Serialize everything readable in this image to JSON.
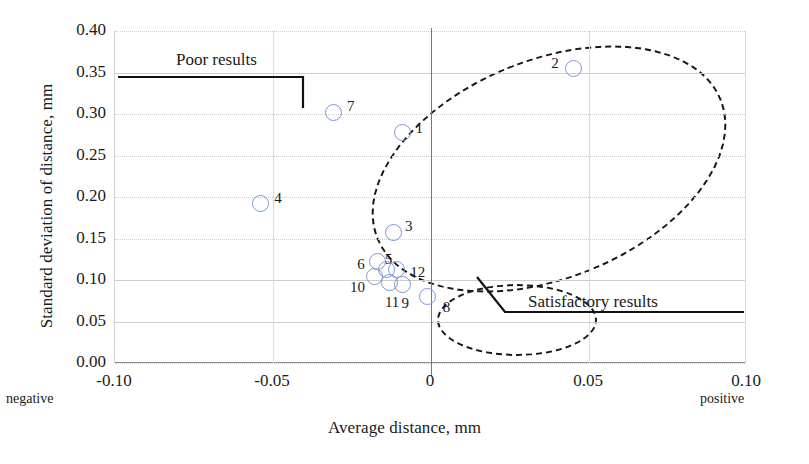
{
  "chart_data": {
    "type": "scatter",
    "title": "",
    "xlabel": "Average distance, mm",
    "ylabel": "Standard deviation of distance, mm",
    "xlim": [
      -0.1,
      0.1
    ],
    "ylim": [
      0.0,
      0.4
    ],
    "xticks": [
      "-0.10",
      "-0.05",
      "0",
      "0.05",
      "0.10"
    ],
    "xtick_values": [
      -0.1,
      -0.05,
      0,
      0.05,
      0.1
    ],
    "yticks": [
      "0.00",
      "0.05",
      "0.10",
      "0.15",
      "0.20",
      "0.25",
      "0.30",
      "0.35",
      "0.40"
    ],
    "ytick_values": [
      0.0,
      0.05,
      0.1,
      0.15,
      0.2,
      0.25,
      0.3,
      0.35,
      0.4
    ],
    "grid": true,
    "legend": "none",
    "marker_style": "open-circle",
    "marker_color": "#7e96cf",
    "reference_line": {
      "axis": "x",
      "value": 0,
      "color": "#5b76c4"
    },
    "axis_end_notes": {
      "left": "negative",
      "right": "positive"
    },
    "points": [
      {
        "label": "1",
        "x": -0.009,
        "y": 0.278
      },
      {
        "label": "2",
        "x": 0.045,
        "y": 0.355
      },
      {
        "label": "3",
        "x": -0.012,
        "y": 0.157
      },
      {
        "label": "4",
        "x": -0.054,
        "y": 0.192
      },
      {
        "label": "5",
        "x": -0.014,
        "y": 0.113
      },
      {
        "label": "6",
        "x": -0.017,
        "y": 0.122
      },
      {
        "label": "7",
        "x": -0.031,
        "y": 0.302
      },
      {
        "label": "8",
        "x": -0.001,
        "y": 0.08
      },
      {
        "label": "9",
        "x": -0.009,
        "y": 0.095
      },
      {
        "label": "10",
        "x": -0.018,
        "y": 0.104
      },
      {
        "label": "11",
        "x": -0.013,
        "y": 0.097
      },
      {
        "label": "12",
        "x": -0.011,
        "y": 0.113
      }
    ],
    "annotations": [
      {
        "name": "poor-results",
        "text": "Poor results",
        "group": "poor"
      },
      {
        "name": "satisfactory-results",
        "text": "Satisfactory results",
        "group": "satisfactory"
      }
    ],
    "groups": [
      {
        "name": "poor",
        "style": "dashed-ellipse",
        "members": [
          "1",
          "2",
          "3",
          "4",
          "7"
        ]
      },
      {
        "name": "satisfactory",
        "style": "dashed-ellipse",
        "members": [
          "5",
          "6",
          "8",
          "9",
          "10",
          "11",
          "12"
        ]
      }
    ]
  }
}
